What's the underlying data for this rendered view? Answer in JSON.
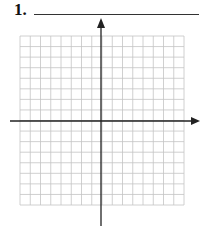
{
  "problem": {
    "number": "1."
  },
  "grid": {
    "rows": 16,
    "cols": 16,
    "line_color": "#bbbbbb",
    "axis_color": "#222222"
  }
}
